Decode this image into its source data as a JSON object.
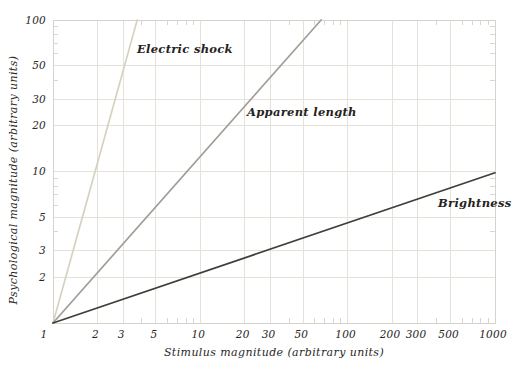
{
  "chart_data": {
    "type": "line",
    "scale": "log-log",
    "title": "",
    "xlabel": "Stimulus magnitude (arbitrary units)",
    "ylabel": "Psychological magnitude (arbitrary units)",
    "xlim": [
      1,
      1000
    ],
    "ylim": [
      1,
      100
    ],
    "x_ticks": [
      1,
      2,
      3,
      5,
      10,
      20,
      30,
      50,
      100,
      200,
      300,
      500,
      1000
    ],
    "y_ticks": [
      1,
      2,
      3,
      5,
      10,
      20,
      30,
      50,
      100
    ],
    "x_minor_ticks": [
      4,
      6,
      7,
      8,
      9,
      40,
      60,
      70,
      80,
      90,
      400,
      600,
      700,
      800,
      900
    ],
    "y_minor_ticks": [
      4,
      6,
      7,
      8,
      9,
      40,
      60,
      70,
      80,
      90
    ],
    "grid": true,
    "legend_position": "inline-labels",
    "colors": {
      "grid": "#e5e2db",
      "frame": "#d6d3cc",
      "minor_tick": "#dad7d0",
      "text": "#2a261f",
      "background": "#ffffff"
    },
    "series": [
      {
        "name": "Electric shock",
        "exponent": 3.5,
        "points": [
          [
            1,
            1
          ],
          [
            3.73,
            100
          ]
        ],
        "color": "#d7d2c0"
      },
      {
        "name": "Apparent length",
        "exponent": 1.1,
        "points": [
          [
            1,
            1
          ],
          [
            66,
            100
          ]
        ],
        "color": "#a19e98"
      },
      {
        "name": "Brightness",
        "exponent": 0.33,
        "points": [
          [
            1,
            1
          ],
          [
            1000,
            9.8
          ]
        ],
        "color": "#413e39"
      }
    ]
  }
}
